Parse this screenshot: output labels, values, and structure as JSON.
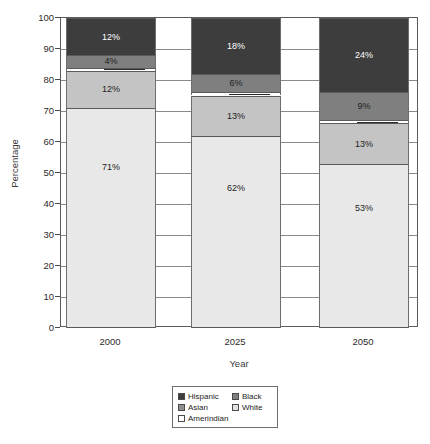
{
  "chart_data": {
    "type": "bar",
    "subtype": "stacked-bar-100",
    "title": "",
    "xlabel": "Year",
    "ylabel": "Percentage",
    "categories": [
      "2000",
      "2025",
      "2050"
    ],
    "ylim": [
      0,
      100
    ],
    "yticks": [
      0,
      10,
      20,
      30,
      40,
      50,
      60,
      70,
      80,
      90,
      100
    ],
    "ytick_labels": [
      "0",
      "10",
      "20",
      "30",
      "40",
      "50",
      "60",
      "70",
      "80",
      "90",
      "100"
    ],
    "grid": true,
    "legend_position": "bottom-center",
    "stack_order_top_to_bottom": [
      "Hispanic",
      "Black",
      "Amerindian",
      "Asian",
      "White"
    ],
    "series": [
      {
        "name": "Hispanic",
        "color": "#3d3d3d",
        "label_color": "#ffffff",
        "values": [
          12,
          18,
          24
        ],
        "labels": [
          "12%",
          "18%",
          "24%"
        ]
      },
      {
        "name": "Black",
        "color": "#7f7f7f",
        "label_color": "#1d1d1d",
        "values": [
          4,
          6,
          9
        ],
        "labels": [
          "4%",
          "6%",
          "9%"
        ]
      },
      {
        "name": "Amerindian",
        "color": "#ffffff",
        "label_color": "#1d1d1d",
        "values": [
          1,
          1,
          1
        ],
        "labels": [
          "1%",
          "1%",
          "1%"
        ],
        "callout": true
      },
      {
        "name": "Asian",
        "color": "#c4c4c4",
        "label_color": "#1d1d1d",
        "values": [
          12,
          13,
          13
        ],
        "labels": [
          "12%",
          "13%",
          "13%"
        ]
      },
      {
        "name": "White",
        "color": "#e8e8e8",
        "label_color": "#1d1d1d",
        "values": [
          71,
          62,
          53
        ],
        "labels": [
          "71%",
          "62%",
          "53%"
        ]
      }
    ]
  },
  "legend": {
    "entries": [
      {
        "label": "Hispanic",
        "color": "#3d3d3d"
      },
      {
        "label": "Black",
        "color": "#7f7f7f"
      },
      {
        "label": "Asian",
        "color": "#8f8f8f"
      },
      {
        "label": "White",
        "color": "#e2e2e2"
      },
      {
        "label": "Amerindian",
        "color": "#ffffff"
      }
    ]
  }
}
